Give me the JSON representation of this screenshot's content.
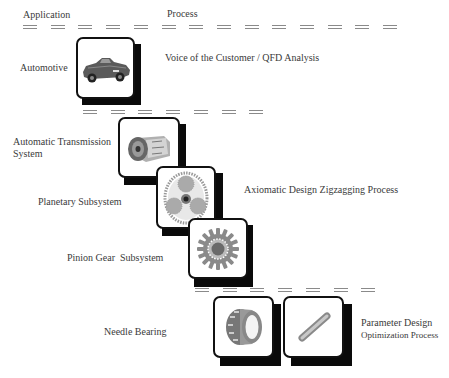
{
  "header": {
    "application_label": "Application",
    "process_label": "Process"
  },
  "levels": [
    {
      "name": "Automotive",
      "icon": "car-icon"
    },
    {
      "name": "Automatic Transmission System",
      "line1": "Automatic Transmission",
      "line2": "System",
      "icon": "transmission-icon"
    },
    {
      "name": "Planetary Subsystem",
      "icon": "planetary-gear-icon"
    },
    {
      "name": "Pinion Gear  Subsystem",
      "icon": "pinion-gear-icon"
    },
    {
      "name": "Needle Bearing",
      "icon": "needle-bearing-icon"
    },
    {
      "name": "Needle",
      "icon": "needle-roller-icon"
    }
  ],
  "processes": [
    {
      "label": "Voice of the Customer / QFD Analysis"
    },
    {
      "label": "Axiomatic Design Zigzagging Process"
    },
    {
      "line1": "Parameter Design",
      "line2": "Optimization Process"
    }
  ],
  "dividers": [
    {
      "y": 25,
      "x0": 23,
      "count": 14,
      "step": 27.7
    },
    {
      "y": 110,
      "x0": 83,
      "count": 7,
      "step": 27.7
    },
    {
      "y": 288,
      "x0": 195,
      "count": 7,
      "step": 27.7
    }
  ],
  "colors": {
    "card_border": "#111111",
    "shadow": "#0a0a0a",
    "dash": "#8a8a8a",
    "text": "#3a3a3a"
  }
}
